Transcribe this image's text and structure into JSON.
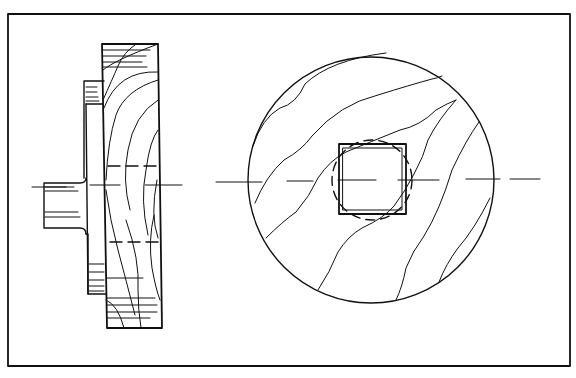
{
  "figure": {
    "colors": {
      "ink": "#111111",
      "paper": "#ffffff"
    },
    "frame": {
      "x": 8,
      "y": 14,
      "width": 562,
      "height": 352
    },
    "side_view": {
      "label": "side-elevation",
      "shaft_stub": {
        "x": 44,
        "y": 183,
        "width": 41,
        "height": 45
      },
      "flange": {
        "x": 86,
        "y": 81,
        "width": 20,
        "height": 214
      },
      "disc": {
        "top_left": [
          102,
          44
        ],
        "top_right": [
          158,
          44
        ],
        "bottom_right": [
          162,
          328
        ],
        "bottom_left": [
          107,
          328
        ]
      },
      "hidden_lines_y": [
        166,
        242
      ],
      "centerline_y": 185
    },
    "front_view": {
      "label": "front-elevation",
      "disc_circle": {
        "cx": 371,
        "cy": 180,
        "r": 123
      },
      "bore_dashed_circle": {
        "cx": 372,
        "cy": 180,
        "r": 40
      },
      "square_hole": {
        "x": 339,
        "y": 144,
        "width": 67,
        "height": 70
      },
      "centerline_y": 180
    }
  }
}
